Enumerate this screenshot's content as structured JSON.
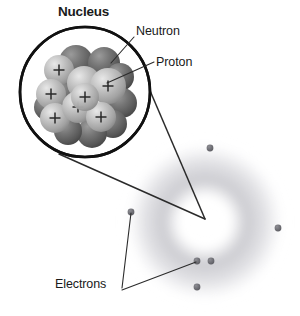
{
  "figure": {
    "kind": "atom-structure-diagram",
    "background_color": "#ffffff",
    "width": 300,
    "height": 316
  },
  "labels": {
    "nucleus": "Nucleus",
    "neutron": "Neutron",
    "proton": "Proton",
    "electrons": "Electrons"
  },
  "colors": {
    "outline": "#111111",
    "leader_line": "#2b2b2b",
    "proton_sphere": "#b4b4b4",
    "neutron_sphere": "#6a6a6a",
    "electron_dot": "#6e6e73",
    "electron_cloud": "#c9c9cd",
    "text": "#1a1a1a"
  },
  "magnifier": {
    "name": "nucleus-magnified-circle",
    "center_x": 85,
    "center_y": 92,
    "radius": 65,
    "stroke_width": 2.6
  },
  "callout_cone": {
    "apex_x": 205,
    "apex_y": 219,
    "from_upper_x": 148,
    "from_upper_y": 86,
    "from_lower_x": 59,
    "from_lower_y": 154
  },
  "nucleus": {
    "proton_count_visible": 7,
    "neutron_count_visible": 9,
    "charge_symbol": "+",
    "protons": [
      {
        "cx": 59,
        "cy": 70,
        "r": 15
      },
      {
        "cx": 51,
        "cy": 94,
        "r": 15
      },
      {
        "cx": 55,
        "cy": 118,
        "r": 15
      },
      {
        "cx": 78,
        "cy": 107,
        "r": 16
      },
      {
        "cx": 84,
        "cy": 83,
        "r": 17
      },
      {
        "cx": 108,
        "cy": 86,
        "r": 18
      },
      {
        "cx": 101,
        "cy": 117,
        "r": 15
      }
    ],
    "neutrons": [
      {
        "cx": 76,
        "cy": 62,
        "r": 17
      },
      {
        "cx": 104,
        "cy": 63,
        "r": 16
      },
      {
        "cx": 120,
        "cy": 77,
        "r": 14
      },
      {
        "cx": 122,
        "cy": 103,
        "r": 15
      },
      {
        "cx": 113,
        "cy": 124,
        "r": 14
      },
      {
        "cx": 92,
        "cy": 133,
        "r": 15
      },
      {
        "cx": 68,
        "cy": 131,
        "r": 14
      },
      {
        "cx": 47,
        "cy": 107,
        "r": 13
      },
      {
        "cx": 64,
        "cy": 94,
        "r": 15
      }
    ]
  },
  "atom": {
    "cloud_center_x": 205,
    "cloud_center_y": 222,
    "cloud_outer_radius": 78,
    "cloud_inner_radius": 32,
    "electrons": [
      {
        "name": "electron-top",
        "cx": 210,
        "cy": 148,
        "r": 3.4
      },
      {
        "name": "electron-right",
        "cx": 278,
        "cy": 228,
        "r": 3.4
      },
      {
        "name": "electron-left",
        "cx": 131,
        "cy": 212,
        "r": 3.4
      },
      {
        "name": "electron-bottom-left",
        "cx": 197,
        "cy": 261,
        "r": 3.4
      },
      {
        "name": "electron-bottom-mid",
        "cx": 211,
        "cy": 261,
        "r": 3.4
      },
      {
        "name": "electron-bottom",
        "cx": 197,
        "cy": 287,
        "r": 3.4
      }
    ]
  },
  "leaders": {
    "neutron": {
      "x1": 134,
      "y1": 37,
      "x2": 111,
      "y2": 63
    },
    "proton": {
      "x1": 154,
      "y1": 62,
      "x2": 107,
      "y2": 83
    },
    "electrons_upper": {
      "x1": 122,
      "y1": 288,
      "x2": 131,
      "y2": 213
    },
    "electrons_lower": {
      "x1": 122,
      "y1": 290,
      "x2": 196,
      "y2": 262
    }
  }
}
